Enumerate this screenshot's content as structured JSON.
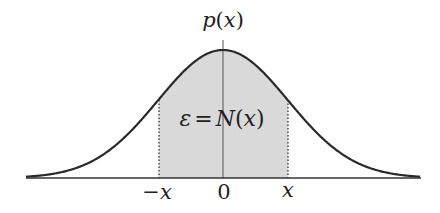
{
  "diagram": {
    "type": "normal-distribution",
    "y_axis_label": "p(x)",
    "region_label": "ε = N(x)",
    "tick_labels": [
      "−x",
      "0",
      "x"
    ],
    "colors": {
      "curve": "#2a2a2a",
      "shaded_region": "#d9d9d9",
      "axis": "#333333",
      "background": "#ffffff"
    },
    "shaded_interval": [
      "-x",
      "x"
    ]
  },
  "labels": {
    "p": "p",
    "x_var": "x",
    "lparen": "(",
    "rparen": ")",
    "epsilon": "ε",
    "equals": "=",
    "N": "N",
    "minus": "−",
    "zero": "0"
  }
}
